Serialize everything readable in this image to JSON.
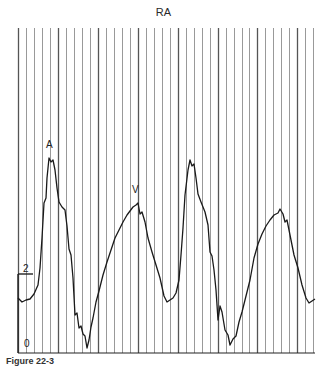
{
  "chart_data": {
    "type": "line",
    "title": "RA",
    "xlabel": "",
    "ylabel": "",
    "y_scale_labels": [
      "2",
      "0"
    ],
    "ylim": [
      0,
      2
    ],
    "grid": {
      "vertical": true,
      "horizontal": false,
      "spacing_px": 8
    },
    "annotations": [
      {
        "text": "A",
        "x": 49,
        "y": 145
      },
      {
        "text": "V",
        "x": 136,
        "y": 190
      }
    ],
    "series": [
      {
        "name": "Right atrial pressure waveform",
        "points": [
          [
            18,
            298
          ],
          [
            22,
            302
          ],
          [
            26,
            300
          ],
          [
            30,
            299
          ],
          [
            34,
            294
          ],
          [
            38,
            285
          ],
          [
            40,
            268
          ],
          [
            42,
            238
          ],
          [
            44,
            203
          ],
          [
            46,
            198
          ],
          [
            47,
            178
          ],
          [
            49,
            158
          ],
          [
            51,
            162
          ],
          [
            53,
            160
          ],
          [
            55,
            170
          ],
          [
            57,
            188
          ],
          [
            59,
            202
          ],
          [
            62,
            207
          ],
          [
            65,
            210
          ],
          [
            67,
            226
          ],
          [
            69,
            249
          ],
          [
            71,
            255
          ],
          [
            73,
            278
          ],
          [
            75,
            315
          ],
          [
            77,
            313
          ],
          [
            79,
            328
          ],
          [
            81,
            326
          ],
          [
            83,
            334
          ],
          [
            85,
            336
          ],
          [
            87,
            348
          ],
          [
            89,
            340
          ],
          [
            91,
            327
          ],
          [
            93,
            318
          ],
          [
            96,
            302
          ],
          [
            99,
            291
          ],
          [
            103,
            275
          ],
          [
            107,
            262
          ],
          [
            111,
            250
          ],
          [
            115,
            238
          ],
          [
            119,
            230
          ],
          [
            123,
            222
          ],
          [
            127,
            215
          ],
          [
            130,
            211
          ],
          [
            133,
            207
          ],
          [
            136,
            205
          ],
          [
            138,
            203
          ],
          [
            140,
            214
          ],
          [
            142,
            212
          ],
          [
            145,
            222
          ],
          [
            148,
            238
          ],
          [
            152,
            252
          ],
          [
            156,
            265
          ],
          [
            160,
            278
          ],
          [
            164,
            296
          ],
          [
            167,
            302
          ],
          [
            170,
            300
          ],
          [
            173,
            298
          ],
          [
            176,
            293
          ],
          [
            179,
            280
          ],
          [
            181,
            255
          ],
          [
            183,
            228
          ],
          [
            185,
            195
          ],
          [
            188,
            170
          ],
          [
            190,
            160
          ],
          [
            192,
            166
          ],
          [
            194,
            164
          ],
          [
            196,
            178
          ],
          [
            198,
            194
          ],
          [
            201,
            202
          ],
          [
            205,
            212
          ],
          [
            208,
            225
          ],
          [
            210,
            252
          ],
          [
            212,
            256
          ],
          [
            214,
            270
          ],
          [
            216,
            290
          ],
          [
            218,
            320
          ],
          [
            220,
            306
          ],
          [
            222,
            312
          ],
          [
            225,
            330
          ],
          [
            228,
            335
          ],
          [
            230,
            345
          ],
          [
            233,
            339
          ],
          [
            236,
            336
          ],
          [
            239,
            322
          ],
          [
            242,
            312
          ],
          [
            246,
            296
          ],
          [
            250,
            280
          ],
          [
            254,
            258
          ],
          [
            258,
            244
          ],
          [
            262,
            234
          ],
          [
            266,
            226
          ],
          [
            270,
            220
          ],
          [
            274,
            215
          ],
          [
            278,
            213
          ],
          [
            280,
            209
          ],
          [
            283,
            214
          ],
          [
            285,
            222
          ],
          [
            287,
            220
          ],
          [
            290,
            235
          ],
          [
            294,
            255
          ],
          [
            298,
            268
          ],
          [
            302,
            285
          ],
          [
            306,
            298
          ],
          [
            309,
            303
          ],
          [
            312,
            301
          ],
          [
            315,
            299
          ]
        ]
      }
    ]
  },
  "figure": {
    "title": "RA",
    "peak_labels": {
      "a_wave": "A",
      "v_wave": "V"
    },
    "scale": {
      "top_label": "2",
      "bottom_label": "0"
    },
    "caption": "Figure 22-3"
  }
}
